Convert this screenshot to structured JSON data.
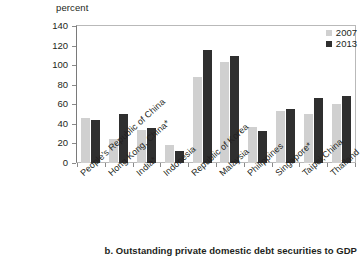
{
  "axis_unit_label": "percent",
  "caption": "b. Outstanding private domestic debt securities to GDP",
  "legend": {
    "items": [
      {
        "label": "2007",
        "color": "#d0d0d0"
      },
      {
        "label": "2013",
        "color": "#2f2f2f"
      }
    ]
  },
  "y_ticks": [
    "140",
    "120",
    "100",
    "80",
    "60",
    "40",
    "20",
    "0"
  ],
  "chart_data": {
    "type": "bar",
    "title": "b. Outstanding private domestic debt securities to GDP",
    "xlabel": "",
    "ylabel": "percent",
    "ylim": [
      0,
      140
    ],
    "ytick_step": 20,
    "grid": false,
    "legend_position": "top-right",
    "categories": [
      "People's Republic of China",
      "Hong Kong, China*",
      "India*",
      "Indonesia",
      "Republic of Korea",
      "Malaysia",
      "Philippines",
      "Singapore*",
      "Taipei,China",
      "Thailand"
    ],
    "series": [
      {
        "name": "2007",
        "color": "#d0d0d0",
        "values": [
          46,
          25,
          34,
          18,
          88,
          103,
          37,
          53,
          50,
          60
        ]
      },
      {
        "name": "2013",
        "color": "#2f2f2f",
        "values": [
          44,
          50,
          36,
          12,
          116,
          109,
          33,
          55,
          66,
          68
        ]
      }
    ]
  }
}
